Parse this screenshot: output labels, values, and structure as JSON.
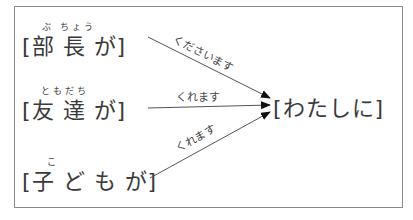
{
  "diagram": {
    "givers": [
      {
        "bracket_open": "[",
        "text": "部 長 が",
        "bracket_close": "]",
        "furigana": "ぶ ちょう",
        "verb": "くださいます"
      },
      {
        "bracket_open": "[",
        "text": "友 達 が",
        "bracket_close": "]",
        "furigana": "ともだち",
        "verb": "くれます"
      },
      {
        "bracket_open": "[",
        "text": "子 ど も が",
        "bracket_close": "]",
        "furigana": "こ",
        "verb": "くれます"
      }
    ],
    "receiver": {
      "text": "[わたしに]"
    },
    "colors": {
      "line": "#555555",
      "arrowhead": "#111111",
      "frame": "#8a8a8a"
    }
  }
}
